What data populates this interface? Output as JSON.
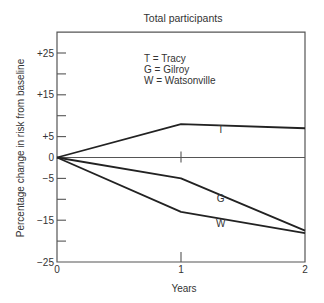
{
  "chart_data": {
    "type": "line",
    "title": "Total participants",
    "xlabel": "Years",
    "ylabel": "Percentage change in risk from baseline",
    "x": [
      0,
      1,
      2
    ],
    "x_ticks": [
      0,
      1,
      2
    ],
    "x_tick_labels": [
      "0",
      "1",
      "2"
    ],
    "xlim": [
      0,
      2
    ],
    "ylim": [
      -25,
      30
    ],
    "y_ticks": [
      25,
      20,
      15,
      10,
      5,
      0,
      -5,
      -10,
      -15,
      -20,
      -25
    ],
    "y_tick_labels": [
      {
        "value": 25,
        "label": "+25"
      },
      {
        "value": 15,
        "label": "+15"
      },
      {
        "value": 5,
        "label": "+5"
      },
      {
        "value": 0,
        "label": "0"
      },
      {
        "value": -5,
        "label": "−5"
      },
      {
        "value": -15,
        "label": "−15"
      },
      {
        "value": -25,
        "label": "−25"
      }
    ],
    "grid": false,
    "reference_line": 0,
    "series": [
      {
        "name": "Tracy",
        "code": "T",
        "values": [
          0,
          8,
          7
        ],
        "label_pos": {
          "x": 1.32,
          "y": 5.8
        }
      },
      {
        "name": "Gilroy",
        "code": "G",
        "values": [
          0,
          -5,
          -17.5
        ],
        "label_pos": {
          "x": 1.32,
          "y": -10.7
        }
      },
      {
        "name": "Watsonville",
        "code": "W",
        "values": [
          0,
          -13,
          -18.1
        ],
        "label_pos": {
          "x": 1.32,
          "y": -16.7
        }
      }
    ],
    "legend": {
      "position": "top-center-inside",
      "entries": [
        "T = Tracy",
        "G = Gilroy",
        "W = Watsonville"
      ]
    },
    "line_color": "#222222",
    "axis_color": "#555555"
  }
}
